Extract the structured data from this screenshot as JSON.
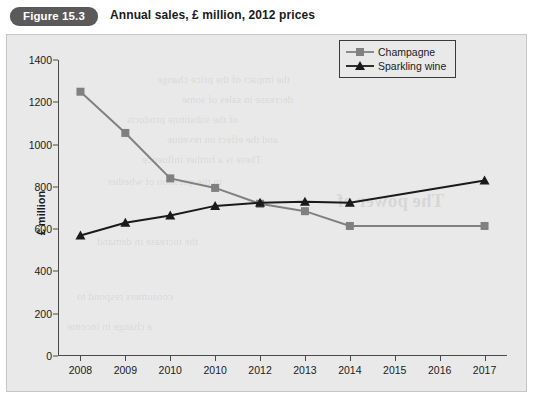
{
  "header": {
    "figure_badge": "Figure 15.3",
    "title": "Annual sales, £ million, 2012 prices"
  },
  "colors": {
    "champagne": "#808080",
    "sparkling": "#1a1a1a",
    "panel_bg": "#e9e9e9",
    "axis": "#4a4a4a",
    "badge_bg": "#5a5a5a"
  },
  "chart_data": {
    "type": "line",
    "title": "Annual sales, £ million, 2012 prices",
    "xlabel": "",
    "ylabel": "£ million",
    "categories": [
      "2008",
      "2009",
      "2010",
      "2010",
      "2012",
      "2013",
      "2014",
      "2015",
      "2016",
      "2017"
    ],
    "ylim": [
      0,
      1400
    ],
    "yticks": [
      0,
      200,
      400,
      600,
      800,
      1000,
      1200,
      1400
    ],
    "grid": false,
    "legend_position": "top-right",
    "series": [
      {
        "name": "Champagne",
        "marker": "square",
        "color": "#808080",
        "x": [
          "2008",
          "2009",
          "2010",
          "2010",
          "2012",
          "2013",
          "2014",
          "2017"
        ],
        "values": [
          1250,
          1055,
          840,
          795,
          720,
          685,
          615,
          615
        ]
      },
      {
        "name": "Sparkling wine",
        "marker": "triangle",
        "color": "#1a1a1a",
        "x": [
          "2008",
          "2009",
          "2010",
          "2010",
          "2012",
          "2013",
          "2014",
          "2017"
        ],
        "values": [
          570,
          630,
          665,
          710,
          725,
          730,
          725,
          830
        ]
      }
    ]
  },
  "bleed_text": {
    "lines": [
      "the impact of the price change",
      "decrease in sales of some",
      "of the substitute products",
      "and the effect on revenue",
      "There is a further influence",
      "in the question of whether",
      "the increase in demand",
      "consumers respond to",
      "a change in income",
      "The power of"
    ]
  }
}
